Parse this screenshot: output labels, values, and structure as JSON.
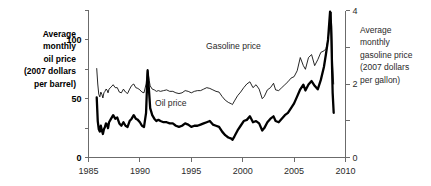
{
  "chart_data": {
    "type": "line",
    "title": "",
    "xlabel": "",
    "ylabel": "Average monthly oil price (2007 dollars per barrel)",
    "y2label": "Average monthly gasoline price (2007 dollars per gallon)",
    "grid": false,
    "legend": "inline-annotations",
    "xlim": [
      1985,
      2010
    ],
    "ylim": [
      0,
      125
    ],
    "y2lim": [
      0,
      4
    ],
    "x_ticks": [
      1985,
      1990,
      1995,
      2000,
      2005,
      2010
    ],
    "x_tick_labels": [
      "1985",
      "1990",
      "1995",
      "2000",
      "2005",
      "2010"
    ],
    "y_ticks": [
      0,
      25,
      50,
      75,
      100,
      125
    ],
    "y_tick_labels": [
      "0",
      "",
      "50",
      "",
      "100",
      ""
    ],
    "y2_ticks": [
      0,
      1,
      2,
      3,
      4
    ],
    "y2_tick_labels": [
      "0",
      "",
      "2",
      "",
      "4"
    ],
    "annotations": [
      {
        "text": "Gasoline price",
        "x": 1999.1,
        "y_frac": 0.74
      },
      {
        "text": "Oil price",
        "x": 1993.0,
        "y_frac": 0.35
      }
    ],
    "series": [
      {
        "name": "Oil price",
        "axis": "left",
        "units": "2007 dollars per barrel",
        "x": [
          1985.8,
          1985.9,
          1986.0,
          1986.1,
          1986.2,
          1986.3,
          1986.4,
          1986.5,
          1986.6,
          1986.7,
          1986.8,
          1986.9,
          1987.0,
          1987.2,
          1987.4,
          1987.6,
          1987.8,
          1988.0,
          1988.2,
          1988.4,
          1988.6,
          1988.8,
          1989.0,
          1989.2,
          1989.4,
          1989.6,
          1989.8,
          1990.0,
          1990.2,
          1990.4,
          1990.6,
          1990.75,
          1990.9,
          1991.0,
          1991.2,
          1991.4,
          1991.6,
          1991.8,
          1992.0,
          1992.3,
          1992.6,
          1992.9,
          1993.2,
          1993.5,
          1993.8,
          1994.1,
          1994.4,
          1994.7,
          1995.0,
          1995.3,
          1995.6,
          1995.9,
          1996.2,
          1996.5,
          1996.8,
          1997.1,
          1997.4,
          1997.7,
          1998.0,
          1998.3,
          1998.6,
          1998.9,
          1999.0,
          1999.2,
          1999.5,
          1999.8,
          2000.1,
          2000.4,
          2000.7,
          2001.0,
          2001.3,
          2001.6,
          2001.9,
          2002.1,
          2002.4,
          2002.7,
          2003.0,
          2003.2,
          2003.5,
          2003.8,
          2004.1,
          2004.4,
          2004.7,
          2005.0,
          2005.3,
          2005.6,
          2005.9,
          2006.1,
          2006.4,
          2006.7,
          2007.0,
          2007.3,
          2007.6,
          2007.9,
          2008.1,
          2008.3,
          2008.5,
          2008.6,
          2008.75,
          2008.85
        ],
        "y": [
          51,
          31,
          24,
          22,
          27,
          23,
          20,
          24,
          26,
          29,
          28,
          25,
          30,
          33,
          36,
          33,
          34,
          29,
          27,
          30,
          27,
          26,
          31,
          33,
          36,
          33,
          32,
          30,
          27,
          26,
          38,
          74,
          55,
          42,
          36,
          33,
          31,
          32,
          31,
          30,
          30,
          29,
          29,
          27,
          26,
          27,
          29,
          28,
          26,
          27,
          27,
          28,
          29,
          30,
          31,
          28,
          27,
          26,
          22,
          19,
          17,
          16,
          15,
          18,
          23,
          27,
          31,
          32,
          35,
          30,
          31,
          29,
          23,
          25,
          30,
          33,
          35,
          31,
          30,
          33,
          36,
          38,
          42,
          46,
          52,
          58,
          62,
          57,
          62,
          65,
          61,
          58,
          66,
          77,
          88,
          100,
          124,
          112,
          55,
          38
        ]
      },
      {
        "name": "Gasoline price",
        "axis": "right",
        "units": "2007 dollars per gallon",
        "x": [
          1985.8,
          1985.9,
          1986.0,
          1986.1,
          1986.2,
          1986.3,
          1986.4,
          1986.5,
          1986.6,
          1986.7,
          1986.8,
          1986.9,
          1987.0,
          1987.2,
          1987.4,
          1987.6,
          1987.8,
          1988.0,
          1988.2,
          1988.4,
          1988.6,
          1988.8,
          1989.0,
          1989.2,
          1989.4,
          1989.6,
          1989.8,
          1990.0,
          1990.2,
          1990.4,
          1990.6,
          1990.75,
          1990.9,
          1991.0,
          1991.2,
          1991.4,
          1991.6,
          1991.8,
          1992.0,
          1992.3,
          1992.6,
          1992.9,
          1993.2,
          1993.5,
          1993.8,
          1994.1,
          1994.4,
          1994.7,
          1995.0,
          1995.3,
          1995.6,
          1995.9,
          1996.2,
          1996.5,
          1996.8,
          1997.1,
          1997.4,
          1997.7,
          1998.0,
          1998.3,
          1998.6,
          1998.9,
          1999.0,
          1999.2,
          1999.5,
          1999.8,
          2000.1,
          2000.4,
          2000.7,
          2001.0,
          2001.3,
          2001.6,
          2001.9,
          2002.1,
          2002.4,
          2002.7,
          2003.0,
          2003.2,
          2003.5,
          2003.8,
          2004.1,
          2004.4,
          2004.7,
          2005.0,
          2005.3,
          2005.6,
          2005.9,
          2006.1,
          2006.4,
          2006.7,
          2007.0,
          2007.3,
          2007.6,
          2007.9,
          2008.1,
          2008.3,
          2008.5,
          2008.6,
          2008.75,
          2008.85
        ],
        "y": [
          2.42,
          2.0,
          1.72,
          1.65,
          1.78,
          1.72,
          1.62,
          1.76,
          1.8,
          1.86,
          1.84,
          1.76,
          1.86,
          1.92,
          1.98,
          1.9,
          1.9,
          1.78,
          1.76,
          1.86,
          1.78,
          1.74,
          1.86,
          1.96,
          2.0,
          1.9,
          1.88,
          1.84,
          1.78,
          1.76,
          2.0,
          2.4,
          2.1,
          1.95,
          1.86,
          1.84,
          1.8,
          1.82,
          1.8,
          1.82,
          1.84,
          1.8,
          1.8,
          1.76,
          1.74,
          1.76,
          1.82,
          1.8,
          1.76,
          1.8,
          1.82,
          1.82,
          1.86,
          1.9,
          1.88,
          1.84,
          1.8,
          1.78,
          1.66,
          1.56,
          1.5,
          1.46,
          1.44,
          1.54,
          1.68,
          1.78,
          1.9,
          2.0,
          2.06,
          1.9,
          1.98,
          1.86,
          1.6,
          1.66,
          1.84,
          1.9,
          2.02,
          1.84,
          1.82,
          1.9,
          1.98,
          2.06,
          2.16,
          2.2,
          2.36,
          2.72,
          2.5,
          2.4,
          2.72,
          2.8,
          2.5,
          2.66,
          2.86,
          2.9,
          2.96,
          3.2,
          3.62,
          3.96,
          2.5,
          2.0
        ]
      }
    ]
  },
  "axis_labels": {
    "left": {
      "lines": [
        "Average",
        "monthly",
        "oil price",
        "(2007 dollars",
        "per barrel)"
      ]
    },
    "right": {
      "lines": [
        "Average",
        "monthly",
        "gasoline price",
        "(2007 dollars",
        "per gallon)"
      ]
    }
  },
  "colors": {
    "background": "#ffffff",
    "axis": "#6b6b6b",
    "oil_series": "#000000",
    "gasoline_series": "#000000",
    "text": "#1a1a1a"
  }
}
